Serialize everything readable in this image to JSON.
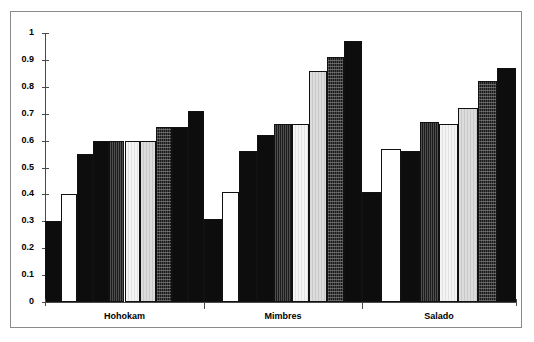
{
  "chart_data": {
    "type": "bar",
    "title": "",
    "xlabel": "",
    "ylabel": "",
    "ylim": [
      0,
      1
    ],
    "ytick_labels": [
      "1",
      "0.9",
      "0.8",
      "0.7",
      "0.6",
      "0.5",
      "0.4",
      "0.3",
      "0.2",
      "0.1",
      "0"
    ],
    "ytick_values": [
      1,
      0.9,
      0.8,
      0.7,
      0.6,
      0.5,
      0.4,
      0.3,
      0.2,
      0.1,
      0
    ],
    "grid": false,
    "legend": "none",
    "categories": [
      "Hohokam",
      "Mimbres",
      "Salado"
    ],
    "series": [
      {
        "name": "series-1",
        "fill": "black",
        "values": [
          0.3,
          0.31,
          0.41
        ]
      },
      {
        "name": "series-2",
        "fill": "white",
        "values": [
          0.4,
          0.41,
          0.57
        ]
      },
      {
        "name": "series-3",
        "fill": "black",
        "values": [
          0.55,
          0.56,
          0.56
        ]
      },
      {
        "name": "series-4",
        "fill": "dark-lined",
        "values": [
          0.6,
          0.62,
          0.67
        ]
      },
      {
        "name": "series-5",
        "fill": "very-light",
        "values": [
          0.6,
          0.66,
          0.66
        ]
      },
      {
        "name": "series-6",
        "fill": "light-gray",
        "values": [
          0.6,
          0.66,
          0.72
        ]
      },
      {
        "name": "series-7",
        "fill": "speckled",
        "values": [
          0.65,
          0.86,
          0.82
        ]
      },
      {
        "name": "series-8",
        "fill": "dark",
        "values": [
          0.65,
          0.91,
          0.82
        ]
      },
      {
        "name": "series-9",
        "fill": "black",
        "values": [
          0.71,
          0.97,
          0.87
        ]
      }
    ],
    "bars": [
      {
        "group": "Hohokam",
        "index": 0,
        "value": 0.3,
        "fill": "black"
      },
      {
        "group": "Hohokam",
        "index": 1,
        "value": 0.4,
        "fill": "white"
      },
      {
        "group": "Hohokam",
        "index": 2,
        "value": 0.55,
        "fill": "black"
      },
      {
        "group": "Hohokam",
        "index": 3,
        "value": 0.6,
        "fill": "black"
      },
      {
        "group": "Hohokam",
        "index": 4,
        "value": 0.6,
        "fill": "dark-lined"
      },
      {
        "group": "Hohokam",
        "index": 5,
        "value": 0.6,
        "fill": "very-light"
      },
      {
        "group": "Hohokam",
        "index": 6,
        "value": 0.6,
        "fill": "light-gray"
      },
      {
        "group": "Hohokam",
        "index": 7,
        "value": 0.65,
        "fill": "speckled"
      },
      {
        "group": "Hohokam",
        "index": 8,
        "value": 0.65,
        "fill": "black"
      },
      {
        "group": "Hohokam",
        "index": 9,
        "value": 0.71,
        "fill": "black"
      },
      {
        "group": "Mimbres",
        "index": 0,
        "value": 0.31,
        "fill": "black"
      },
      {
        "group": "Mimbres",
        "index": 1,
        "value": 0.41,
        "fill": "white"
      },
      {
        "group": "Mimbres",
        "index": 2,
        "value": 0.56,
        "fill": "black"
      },
      {
        "group": "Mimbres",
        "index": 3,
        "value": 0.62,
        "fill": "black"
      },
      {
        "group": "Mimbres",
        "index": 4,
        "value": 0.66,
        "fill": "dark-lined"
      },
      {
        "group": "Mimbres",
        "index": 5,
        "value": 0.66,
        "fill": "very-light"
      },
      {
        "group": "Mimbres",
        "index": 6,
        "value": 0.86,
        "fill": "light-gray"
      },
      {
        "group": "Mimbres",
        "index": 7,
        "value": 0.91,
        "fill": "speckled"
      },
      {
        "group": "Mimbres",
        "index": 8,
        "value": 0.97,
        "fill": "black"
      },
      {
        "group": "Salado",
        "index": 0,
        "value": 0.41,
        "fill": "black"
      },
      {
        "group": "Salado",
        "index": 1,
        "value": 0.57,
        "fill": "white"
      },
      {
        "group": "Salado",
        "index": 2,
        "value": 0.56,
        "fill": "black"
      },
      {
        "group": "Salado",
        "index": 3,
        "value": 0.67,
        "fill": "dark-lined"
      },
      {
        "group": "Salado",
        "index": 4,
        "value": 0.66,
        "fill": "very-light"
      },
      {
        "group": "Salado",
        "index": 5,
        "value": 0.72,
        "fill": "light-gray"
      },
      {
        "group": "Salado",
        "index": 6,
        "value": 0.82,
        "fill": "speckled"
      },
      {
        "group": "Salado",
        "index": 7,
        "value": 0.87,
        "fill": "black"
      }
    ]
  }
}
